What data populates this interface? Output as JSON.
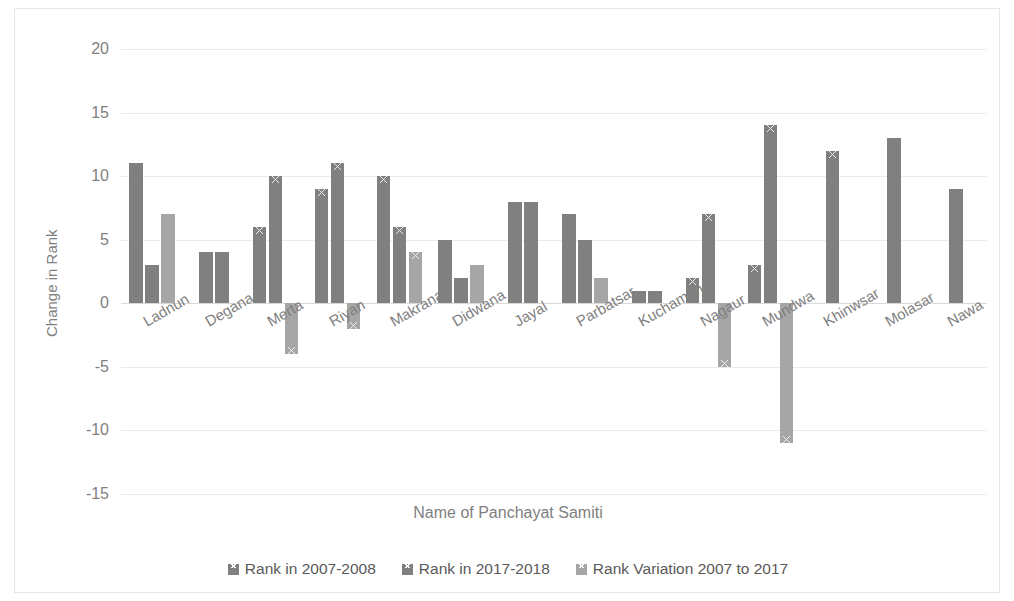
{
  "chart_data": {
    "type": "bar",
    "title": "",
    "xlabel": "Name of Panchayat Samiti",
    "ylabel": "Change in Rank",
    "ylim": [
      -15,
      20
    ],
    "yticks": [
      20,
      15,
      10,
      5,
      0,
      -5,
      -10,
      -15
    ],
    "ytick_labels": [
      "20",
      "15",
      "10",
      "5",
      "0",
      "-5",
      "-10",
      "-15"
    ],
    "grid": true,
    "legend_position": "bottom",
    "categories": [
      "Ladnun",
      "Degana",
      "Merta",
      "Riyan",
      "Makrana",
      "Didwana",
      "Jayal",
      "Parbatsar",
      "Kuchaman",
      "Nagaur",
      "Mundwa",
      "Khinwsar",
      "Molasar",
      "Nawa"
    ],
    "series": [
      {
        "name": "Rank in 2007-2008",
        "color": "#808080",
        "values": [
          11,
          4,
          6,
          9,
          10,
          5,
          8,
          7,
          1,
          2,
          3,
          12,
          13,
          9
        ]
      },
      {
        "name": "Rank in 2017-2018",
        "color": "#808080",
        "values": [
          3,
          4,
          10,
          11,
          6,
          2,
          8,
          5,
          1,
          7,
          14,
          null,
          null,
          null
        ]
      },
      {
        "name": "Rank Variation 2007 to 2017",
        "color": "#a6a6a6",
        "values": [
          7,
          null,
          -4,
          -2,
          4,
          3,
          null,
          2,
          null,
          -5,
          -11,
          null,
          null,
          null
        ]
      }
    ]
  },
  "axes": {
    "y_title": "Change in Rank",
    "x_title": "Name of Panchayat Samiti"
  },
  "legend": {
    "items": [
      {
        "label": "Rank in 2007-2008",
        "color": "#808080"
      },
      {
        "label": "Rank in 2017-2018",
        "color": "#808080"
      },
      {
        "label": "Rank Variation 2007 to 2017",
        "color": "#a6a6a6"
      }
    ]
  }
}
